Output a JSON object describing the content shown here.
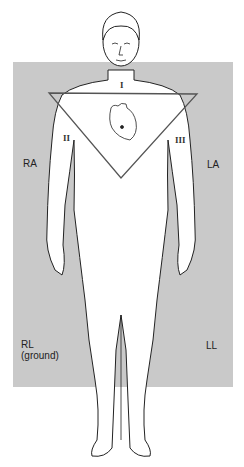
{
  "diagram": {
    "colors": {
      "panel": "#c9c9c9",
      "line": "#222222",
      "triangle": "#555555"
    },
    "leads": {
      "I": "I",
      "II": "II",
      "III": "III"
    },
    "electrodes": {
      "ra": "RA",
      "la": "LA",
      "rl": "RL",
      "rl_note": "(ground)",
      "ll": "LL"
    }
  }
}
